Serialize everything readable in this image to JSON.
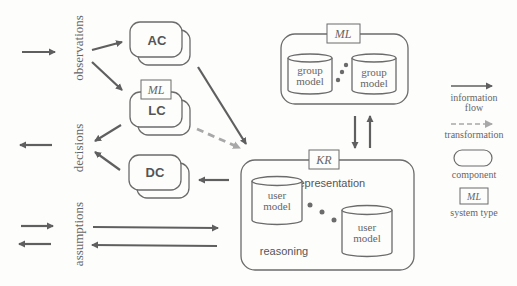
{
  "diagram": {
    "side_labels": {
      "observations": "observations",
      "decisions": "decisions",
      "assumptions": "assumptions"
    },
    "components": {
      "ac": "AC",
      "lc": "LC",
      "dc": "DC"
    },
    "system_types": {
      "lc_tag": "ML",
      "group_tag": "ML",
      "kr_tag": "KR"
    },
    "group_box": {
      "models": [
        {
          "line1": "group",
          "line2": "model"
        },
        {
          "line1": "group",
          "line2": "model"
        }
      ]
    },
    "kr_box": {
      "representation": "representation",
      "reasoning": "reasoning",
      "models": [
        {
          "line1": "user",
          "line2": "model"
        },
        {
          "line1": "user",
          "line2": "model"
        }
      ]
    },
    "legend": {
      "information_flow_1": "information",
      "information_flow_2": "flow",
      "transformation": "transformation",
      "component": "component",
      "system_type_tag": "ML",
      "system_type": "system type"
    },
    "colors": {
      "stroke": "#6b6b6b",
      "arrow": "#5f5f5f",
      "dashed": "#a8a8a8",
      "text": "#555555"
    }
  }
}
